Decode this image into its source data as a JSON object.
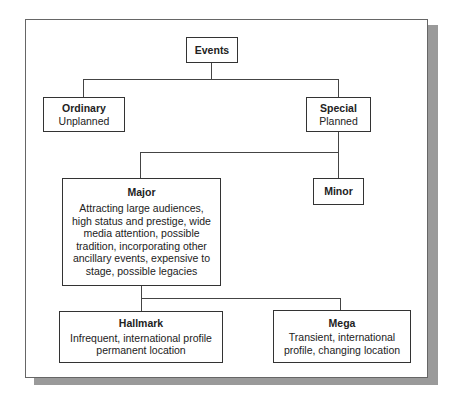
{
  "diagram": {
    "type": "hierarchy",
    "nodes": {
      "events": {
        "title": "Events",
        "desc": ""
      },
      "ordinary": {
        "title": "Ordinary",
        "desc": "Unplanned"
      },
      "special": {
        "title": "Special",
        "desc": "Planned"
      },
      "major": {
        "title": "Major",
        "desc": "Attracting large audiences, high status and prestige, wide media attention, possible tradition, incorporating other ancillary events, expensive to stage, possible legacies"
      },
      "minor": {
        "title": "Minor",
        "desc": ""
      },
      "hallmark": {
        "title": "Hallmark",
        "desc": "Infrequent, international profile permanent location"
      },
      "mega": {
        "title": "Mega",
        "desc": "Transient, international profile, changing location"
      }
    },
    "edges": [
      [
        "events",
        "ordinary"
      ],
      [
        "events",
        "special"
      ],
      [
        "special",
        "major"
      ],
      [
        "special",
        "minor"
      ],
      [
        "major",
        "hallmark"
      ],
      [
        "major",
        "mega"
      ]
    ]
  }
}
